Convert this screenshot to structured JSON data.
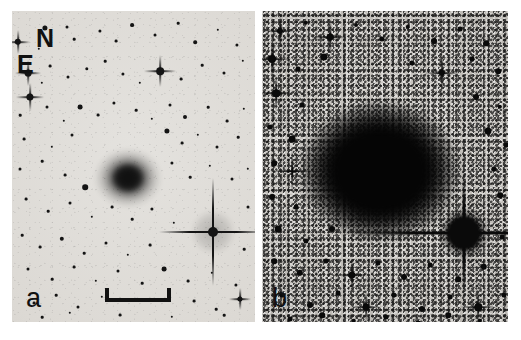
{
  "figure": {
    "kind": "two-panel astronomical image",
    "background_color": "#ffffff",
    "rendering": "negative grayscale (stars and galaxy appear dark on light sky)"
  },
  "annotations": {
    "compass": {
      "north_label": "N",
      "east_label": "E",
      "color": "#111111"
    },
    "scale_bar": {
      "visible": true,
      "color": "#111111"
    }
  },
  "panels": [
    {
      "id": "a",
      "label": "a",
      "description": "shallow contrast stretch",
      "sky_color": "#dedbd6",
      "object_color": "#141414",
      "galaxy": {
        "name": "central-galaxy",
        "cx": 116,
        "cy": 167,
        "rx": 34,
        "ry": 30,
        "core_rx": 17,
        "core_ry": 15
      },
      "bright_star": {
        "name": "bright-star-with-spikes",
        "cx": 201,
        "cy": 221,
        "r": 5,
        "spike_len": 54,
        "halo_r": 22
      },
      "stars": [
        {
          "x": 33,
          "y": 17,
          "r": 2.6
        },
        {
          "x": 55,
          "y": 16,
          "r": 1.5
        },
        {
          "x": 6,
          "y": 31,
          "r": 3.2
        },
        {
          "x": 62,
          "y": 28,
          "r": 1.3
        },
        {
          "x": 27,
          "y": 38,
          "r": 1.2
        },
        {
          "x": 88,
          "y": 20,
          "r": 1.6
        },
        {
          "x": 104,
          "y": 30,
          "r": 1.4
        },
        {
          "x": 120,
          "y": 14,
          "r": 1.9
        },
        {
          "x": 143,
          "y": 24,
          "r": 1.5
        },
        {
          "x": 166,
          "y": 12,
          "r": 1.3
        },
        {
          "x": 183,
          "y": 31,
          "r": 1.8
        },
        {
          "x": 206,
          "y": 19,
          "r": 1.2
        },
        {
          "x": 225,
          "y": 34,
          "r": 1.6
        },
        {
          "x": 16,
          "y": 62,
          "r": 3.4
        },
        {
          "x": 38,
          "y": 55,
          "r": 1.4
        },
        {
          "x": 30,
          "y": 72,
          "r": 1.2
        },
        {
          "x": 18,
          "y": 86,
          "r": 3.6
        },
        {
          "x": 56,
          "y": 66,
          "r": 1.5
        },
        {
          "x": 75,
          "y": 58,
          "r": 1.7
        },
        {
          "x": 93,
          "y": 50,
          "r": 1.3
        },
        {
          "x": 111,
          "y": 63,
          "r": 1.6
        },
        {
          "x": 128,
          "y": 72,
          "r": 1.2
        },
        {
          "x": 148,
          "y": 60,
          "r": 3.8
        },
        {
          "x": 169,
          "y": 68,
          "r": 1.4
        },
        {
          "x": 190,
          "y": 54,
          "r": 1.3
        },
        {
          "x": 212,
          "y": 62,
          "r": 1.5
        },
        {
          "x": 231,
          "y": 50,
          "r": 1.2
        },
        {
          "x": 8,
          "y": 104,
          "r": 1.3
        },
        {
          "x": 35,
          "y": 96,
          "r": 1.5
        },
        {
          "x": 52,
          "y": 110,
          "r": 1.2
        },
        {
          "x": 68,
          "y": 96,
          "r": 2.4
        },
        {
          "x": 86,
          "y": 104,
          "r": 1.4
        },
        {
          "x": 102,
          "y": 92,
          "r": 1.6
        },
        {
          "x": 124,
          "y": 99,
          "r": 1.3
        },
        {
          "x": 140,
          "y": 108,
          "r": 1.2
        },
        {
          "x": 158,
          "y": 94,
          "r": 1.5
        },
        {
          "x": 173,
          "y": 106,
          "r": 2.0
        },
        {
          "x": 196,
          "y": 96,
          "r": 1.3
        },
        {
          "x": 215,
          "y": 110,
          "r": 1.4
        },
        {
          "x": 232,
          "y": 98,
          "r": 1.2
        },
        {
          "x": 12,
          "y": 128,
          "r": 1.4
        },
        {
          "x": 40,
          "y": 136,
          "r": 1.2
        },
        {
          "x": 60,
          "y": 124,
          "r": 1.5
        },
        {
          "x": 155,
          "y": 120,
          "r": 2.6
        },
        {
          "x": 170,
          "y": 132,
          "r": 1.4
        },
        {
          "x": 186,
          "y": 124,
          "r": 1.2
        },
        {
          "x": 205,
          "y": 136,
          "r": 1.5
        },
        {
          "x": 226,
          "y": 126,
          "r": 1.3
        },
        {
          "x": 8,
          "y": 158,
          "r": 1.5
        },
        {
          "x": 30,
          "y": 150,
          "r": 1.3
        },
        {
          "x": 53,
          "y": 164,
          "r": 1.4
        },
        {
          "x": 73,
          "y": 176,
          "r": 2.8
        },
        {
          "x": 160,
          "y": 152,
          "r": 1.6
        },
        {
          "x": 178,
          "y": 166,
          "r": 1.3
        },
        {
          "x": 198,
          "y": 155,
          "r": 1.2
        },
        {
          "x": 220,
          "y": 168,
          "r": 1.5
        },
        {
          "x": 236,
          "y": 158,
          "r": 1.2
        },
        {
          "x": 14,
          "y": 188,
          "r": 1.4
        },
        {
          "x": 36,
          "y": 200,
          "r": 1.3
        },
        {
          "x": 58,
          "y": 192,
          "r": 1.5
        },
        {
          "x": 80,
          "y": 206,
          "r": 1.2
        },
        {
          "x": 100,
          "y": 196,
          "r": 1.4
        },
        {
          "x": 120,
          "y": 208,
          "r": 1.3
        },
        {
          "x": 140,
          "y": 198,
          "r": 1.6
        },
        {
          "x": 162,
          "y": 212,
          "r": 1.2
        },
        {
          "x": 236,
          "y": 196,
          "r": 1.5
        },
        {
          "x": 10,
          "y": 224,
          "r": 1.3
        },
        {
          "x": 28,
          "y": 236,
          "r": 1.4
        },
        {
          "x": 50,
          "y": 228,
          "r": 2.2
        },
        {
          "x": 72,
          "y": 242,
          "r": 1.3
        },
        {
          "x": 94,
          "y": 232,
          "r": 1.5
        },
        {
          "x": 116,
          "y": 244,
          "r": 1.2
        },
        {
          "x": 138,
          "y": 234,
          "r": 1.4
        },
        {
          "x": 232,
          "y": 238,
          "r": 1.3
        },
        {
          "x": 16,
          "y": 258,
          "r": 1.5
        },
        {
          "x": 40,
          "y": 268,
          "r": 1.3
        },
        {
          "x": 62,
          "y": 256,
          "r": 1.4
        },
        {
          "x": 84,
          "y": 270,
          "r": 1.2
        },
        {
          "x": 106,
          "y": 260,
          "r": 1.5
        },
        {
          "x": 130,
          "y": 272,
          "r": 1.3
        },
        {
          "x": 152,
          "y": 258,
          "r": 2.4
        },
        {
          "x": 176,
          "y": 270,
          "r": 1.4
        },
        {
          "x": 200,
          "y": 262,
          "r": 1.2
        },
        {
          "x": 224,
          "y": 274,
          "r": 1.6
        },
        {
          "x": 22,
          "y": 292,
          "r": 1.4
        },
        {
          "x": 44,
          "y": 284,
          "r": 1.3
        },
        {
          "x": 66,
          "y": 296,
          "r": 1.5
        },
        {
          "x": 90,
          "y": 286,
          "r": 1.2
        },
        {
          "x": 182,
          "y": 290,
          "r": 1.4
        },
        {
          "x": 204,
          "y": 298,
          "r": 1.3
        },
        {
          "x": 228,
          "y": 288,
          "r": 2.6
        },
        {
          "x": 30,
          "y": 306,
          "r": 1.3
        },
        {
          "x": 58,
          "y": 302,
          "r": 1.2
        },
        {
          "x": 108,
          "y": 304,
          "r": 1.4
        },
        {
          "x": 160,
          "y": 306,
          "r": 1.2
        },
        {
          "x": 212,
          "y": 304,
          "r": 1.3
        }
      ],
      "spike_stars": [
        {
          "x": 16,
          "y": 62,
          "r": 3.4,
          "len": 13
        },
        {
          "x": 18,
          "y": 86,
          "r": 3.6,
          "len": 14
        },
        {
          "x": 148,
          "y": 60,
          "r": 3.8,
          "len": 16
        },
        {
          "x": 6,
          "y": 31,
          "r": 3.2,
          "len": 12
        },
        {
          "x": 228,
          "y": 288,
          "r": 2.6,
          "len": 11
        }
      ]
    },
    {
      "id": "b",
      "label": "b",
      "description": "deep contrast stretch revealing extended halo",
      "sky_color": "#b9b6b1",
      "object_color": "#0a0a0a",
      "galaxy": {
        "name": "central-galaxy",
        "cx": 118,
        "cy": 160,
        "rx": 82,
        "ry": 72,
        "core_rx": 56,
        "core_ry": 48
      },
      "bright_star": {
        "name": "bright-star-saturated",
        "cx": 202,
        "cy": 222,
        "r": 17,
        "spike_len": 120,
        "halo_r": 26
      },
      "stars": [
        {
          "x": 18,
          "y": 20,
          "r": 3.0
        },
        {
          "x": 44,
          "y": 12,
          "r": 2.2
        },
        {
          "x": 68,
          "y": 26,
          "r": 3.4
        },
        {
          "x": 94,
          "y": 14,
          "r": 2.0
        },
        {
          "x": 120,
          "y": 28,
          "r": 2.6
        },
        {
          "x": 146,
          "y": 16,
          "r": 2.2
        },
        {
          "x": 172,
          "y": 30,
          "r": 3.0
        },
        {
          "x": 198,
          "y": 18,
          "r": 2.4
        },
        {
          "x": 224,
          "y": 32,
          "r": 2.8
        },
        {
          "x": 10,
          "y": 48,
          "r": 4.0
        },
        {
          "x": 36,
          "y": 58,
          "r": 2.4
        },
        {
          "x": 62,
          "y": 46,
          "r": 3.6
        },
        {
          "x": 150,
          "y": 52,
          "r": 2.6
        },
        {
          "x": 180,
          "y": 62,
          "r": 3.2
        },
        {
          "x": 210,
          "y": 48,
          "r": 2.4
        },
        {
          "x": 236,
          "y": 60,
          "r": 2.8
        },
        {
          "x": 14,
          "y": 82,
          "r": 3.8
        },
        {
          "x": 40,
          "y": 94,
          "r": 2.6
        },
        {
          "x": 214,
          "y": 86,
          "r": 3.0
        },
        {
          "x": 238,
          "y": 96,
          "r": 2.2
        },
        {
          "x": 8,
          "y": 116,
          "r": 2.6
        },
        {
          "x": 30,
          "y": 128,
          "r": 3.4
        },
        {
          "x": 226,
          "y": 120,
          "r": 3.6
        },
        {
          "x": 244,
          "y": 134,
          "r": 2.4
        },
        {
          "x": 12,
          "y": 152,
          "r": 2.8
        },
        {
          "x": 232,
          "y": 158,
          "r": 2.6
        },
        {
          "x": 10,
          "y": 186,
          "r": 3.0
        },
        {
          "x": 34,
          "y": 196,
          "r": 2.4
        },
        {
          "x": 238,
          "y": 184,
          "r": 2.8
        },
        {
          "x": 16,
          "y": 218,
          "r": 3.4
        },
        {
          "x": 44,
          "y": 230,
          "r": 2.6
        },
        {
          "x": 70,
          "y": 218,
          "r": 3.0
        },
        {
          "x": 240,
          "y": 226,
          "r": 2.4
        },
        {
          "x": 12,
          "y": 250,
          "r": 2.8
        },
        {
          "x": 38,
          "y": 262,
          "r": 3.2
        },
        {
          "x": 64,
          "y": 250,
          "r": 2.4
        },
        {
          "x": 90,
          "y": 264,
          "r": 3.6
        },
        {
          "x": 116,
          "y": 252,
          "r": 2.6
        },
        {
          "x": 142,
          "y": 266,
          "r": 3.0
        },
        {
          "x": 168,
          "y": 254,
          "r": 2.4
        },
        {
          "x": 196,
          "y": 268,
          "r": 2.8
        },
        {
          "x": 222,
          "y": 256,
          "r": 3.2
        },
        {
          "x": 20,
          "y": 284,
          "r": 2.6
        },
        {
          "x": 48,
          "y": 294,
          "r": 3.0
        },
        {
          "x": 76,
          "y": 282,
          "r": 2.4
        },
        {
          "x": 104,
          "y": 296,
          "r": 3.4
        },
        {
          "x": 132,
          "y": 284,
          "r": 2.6
        },
        {
          "x": 160,
          "y": 298,
          "r": 3.0
        },
        {
          "x": 188,
          "y": 286,
          "r": 2.4
        },
        {
          "x": 216,
          "y": 296,
          "r": 3.8
        },
        {
          "x": 242,
          "y": 284,
          "r": 2.6
        },
        {
          "x": 28,
          "y": 308,
          "r": 2.4
        },
        {
          "x": 60,
          "y": 304,
          "r": 2.8
        },
        {
          "x": 92,
          "y": 310,
          "r": 2.2
        },
        {
          "x": 124,
          "y": 306,
          "r": 2.6
        },
        {
          "x": 156,
          "y": 312,
          "r": 2.4
        },
        {
          "x": 186,
          "y": 304,
          "r": 2.8
        },
        {
          "x": 218,
          "y": 310,
          "r": 2.2
        }
      ],
      "spike_stars": [
        {
          "x": 18,
          "y": 20,
          "r": 3.0,
          "len": 15
        },
        {
          "x": 68,
          "y": 26,
          "r": 3.4,
          "len": 17
        },
        {
          "x": 10,
          "y": 48,
          "r": 4.0,
          "len": 20
        },
        {
          "x": 14,
          "y": 82,
          "r": 3.8,
          "len": 19
        },
        {
          "x": 180,
          "y": 62,
          "r": 3.2,
          "len": 18
        },
        {
          "x": 30,
          "y": 160,
          "r": 4.2,
          "len": 22
        },
        {
          "x": 216,
          "y": 296,
          "r": 3.8,
          "len": 18
        },
        {
          "x": 104,
          "y": 296,
          "r": 3.4,
          "len": 15
        },
        {
          "x": 90,
          "y": 264,
          "r": 3.6,
          "len": 16
        }
      ]
    }
  ]
}
